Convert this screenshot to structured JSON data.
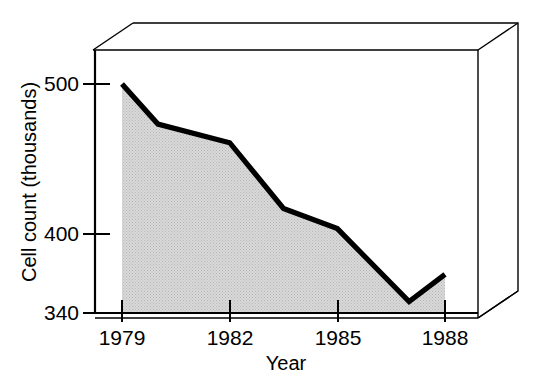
{
  "chart_data": {
    "type": "area",
    "title": "",
    "xlabel": "Year",
    "ylabel": "Cell count (thousands)",
    "x": [
      1979,
      1980,
      1982,
      1983.5,
      1985,
      1987,
      1988
    ],
    "values": [
      500,
      472,
      459,
      413,
      399,
      348,
      367
    ],
    "series": [
      {
        "name": "Cell count",
        "values": [
          500,
          472,
          459,
          413,
          399,
          348,
          367
        ]
      }
    ],
    "xlim": [
      1979,
      1988
    ],
    "ylim": [
      340,
      500
    ],
    "xticks": [
      1979,
      1982,
      1985,
      1988
    ],
    "xtick_labels": [
      "1979",
      "1982",
      "1985",
      "1988"
    ],
    "yticks": [
      340,
      400,
      500
    ],
    "ytick_labels": [
      "340",
      "400",
      "500"
    ],
    "grid": false,
    "legend": "none",
    "fill_color": "#d9d9d9",
    "line_color": "#000000",
    "frame_color": "#000000",
    "style": "3d-box-frame"
  },
  "axes": {
    "y_label": "Cell count (thousands)",
    "x_label": "Year",
    "y_ticks": [
      {
        "label": "500",
        "value": 500
      },
      {
        "label": "400",
        "value": 400
      },
      {
        "label": "340",
        "value": 340
      }
    ],
    "x_ticks": [
      {
        "label": "1979",
        "value": 1979
      },
      {
        "label": "1982",
        "value": 1982
      },
      {
        "label": "1985",
        "value": 1985
      },
      {
        "label": "1988",
        "value": 1988
      }
    ]
  }
}
